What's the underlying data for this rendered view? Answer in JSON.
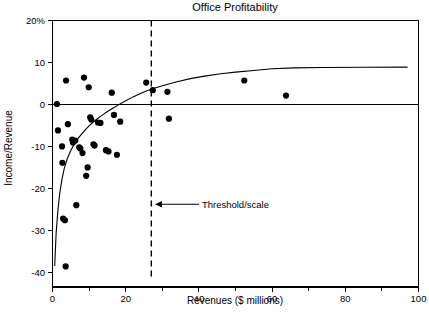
{
  "chart_data": {
    "type": "scatter",
    "title": "Office Profitability",
    "xlabel": "Revenues ($ millions)",
    "ylabel": "Income/Revenue",
    "xlim": [
      0,
      100
    ],
    "ylim": [
      -41,
      20
    ],
    "grid": false,
    "legend": null,
    "x_ticks": [
      0,
      20,
      40,
      60,
      80,
      100
    ],
    "x_tick_labels": [
      "0",
      "20",
      "40",
      "60",
      "80",
      "100"
    ],
    "x_minor_ticks": [
      10,
      30,
      50,
      70,
      90
    ],
    "y_ticks": [
      20,
      10,
      0,
      -10,
      -20,
      -30,
      -40
    ],
    "y_tick_labels": [
      "20%",
      "10",
      "0",
      "-10",
      "-20",
      "-30",
      "-40"
    ],
    "points": [
      {
        "x": 1.2,
        "y": 0.1
      },
      {
        "x": 1.5,
        "y": -6.2
      },
      {
        "x": 2.6,
        "y": -10.0
      },
      {
        "x": 2.7,
        "y": -13.9
      },
      {
        "x": 2.9,
        "y": -27.2
      },
      {
        "x": 3.4,
        "y": -27.6
      },
      {
        "x": 3.6,
        "y": -38.6
      },
      {
        "x": 3.7,
        "y": 5.7
      },
      {
        "x": 4.2,
        "y": -4.7
      },
      {
        "x": 5.4,
        "y": -8.4
      },
      {
        "x": 5.6,
        "y": -9.1
      },
      {
        "x": 6.2,
        "y": -8.6
      },
      {
        "x": 6.5,
        "y": -24.0
      },
      {
        "x": 7.3,
        "y": -10.2
      },
      {
        "x": 7.6,
        "y": -10.5
      },
      {
        "x": 8.2,
        "y": -11.6
      },
      {
        "x": 8.6,
        "y": 6.4
      },
      {
        "x": 9.2,
        "y": -17.0
      },
      {
        "x": 9.6,
        "y": -15.0
      },
      {
        "x": 9.9,
        "y": 4.1
      },
      {
        "x": 10.3,
        "y": -3.1
      },
      {
        "x": 10.6,
        "y": -3.6
      },
      {
        "x": 11.2,
        "y": -9.5
      },
      {
        "x": 11.5,
        "y": -9.8
      },
      {
        "x": 12.4,
        "y": -4.3
      },
      {
        "x": 13.1,
        "y": -4.4
      },
      {
        "x": 14.6,
        "y": -10.9
      },
      {
        "x": 15.3,
        "y": -11.2
      },
      {
        "x": 16.2,
        "y": 2.8
      },
      {
        "x": 16.8,
        "y": -2.5
      },
      {
        "x": 17.6,
        "y": -12.0
      },
      {
        "x": 18.5,
        "y": -4.1
      },
      {
        "x": 25.6,
        "y": 5.2
      },
      {
        "x": 27.4,
        "y": 3.4
      },
      {
        "x": 31.4,
        "y": 3.0
      },
      {
        "x": 31.8,
        "y": -3.4
      },
      {
        "x": 52.4,
        "y": 5.7
      },
      {
        "x": 63.8,
        "y": 2.1
      }
    ],
    "fit_curve": {
      "label": "fitted-trend-curve",
      "description": "asymptotic trend curve rising from -38 toward +9",
      "asymptote": 9.0,
      "points": [
        {
          "x": 0.6,
          "y": -38.5
        },
        {
          "x": 1.0,
          "y": -30.5
        },
        {
          "x": 1.5,
          "y": -25.0
        },
        {
          "x": 2.0,
          "y": -21.0
        },
        {
          "x": 2.6,
          "y": -17.8
        },
        {
          "x": 3.2,
          "y": -15.3
        },
        {
          "x": 4.0,
          "y": -13.0
        },
        {
          "x": 5.0,
          "y": -11.0
        },
        {
          "x": 6.0,
          "y": -9.4
        },
        {
          "x": 7.0,
          "y": -8.1
        },
        {
          "x": 8.0,
          "y": -7.0
        },
        {
          "x": 9.0,
          "y": -6.0
        },
        {
          "x": 10.0,
          "y": -5.1
        },
        {
          "x": 11.0,
          "y": -4.3
        },
        {
          "x": 12.0,
          "y": -3.6
        },
        {
          "x": 13.0,
          "y": -2.9
        },
        {
          "x": 14.0,
          "y": -2.3
        },
        {
          "x": 15.0,
          "y": -1.7
        },
        {
          "x": 16.5,
          "y": -0.9
        },
        {
          "x": 18.0,
          "y": -0.1
        },
        {
          "x": 20.0,
          "y": 0.9
        },
        {
          "x": 22.0,
          "y": 1.8
        },
        {
          "x": 24.0,
          "y": 2.6
        },
        {
          "x": 26.0,
          "y": 3.3
        },
        {
          "x": 28.0,
          "y": 3.9
        },
        {
          "x": 31.0,
          "y": 4.7
        },
        {
          "x": 34.0,
          "y": 5.4
        },
        {
          "x": 38.0,
          "y": 6.2
        },
        {
          "x": 42.0,
          "y": 6.8
        },
        {
          "x": 46.0,
          "y": 7.3
        },
        {
          "x": 50.0,
          "y": 7.7
        },
        {
          "x": 55.0,
          "y": 8.1
        },
        {
          "x": 60.0,
          "y": 8.5
        },
        {
          "x": 66.0,
          "y": 8.7
        },
        {
          "x": 74.0,
          "y": 8.8
        },
        {
          "x": 85.0,
          "y": 8.85
        },
        {
          "x": 97.0,
          "y": 8.9
        }
      ]
    },
    "annotations": [
      {
        "name": "threshold-scale",
        "text": "Threshold/scale",
        "arrow_tip_x": 28.0,
        "arrow_tail_x": 40.0,
        "y": -23.8
      }
    ],
    "reference_lines": [
      {
        "name": "zero-reference-line",
        "orientation": "horizontal",
        "value": 0
      },
      {
        "name": "threshold-line",
        "orientation": "vertical",
        "value": 27.0,
        "style": "dashed"
      }
    ],
    "colors": {
      "axis": "#000000",
      "point": "#000000",
      "curve": "#000000",
      "background": "#ffffff"
    }
  }
}
